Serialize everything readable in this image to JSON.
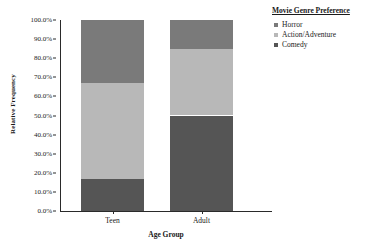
{
  "chart_data": {
    "type": "bar",
    "variant": "stacked-100-percent",
    "title": "",
    "xlabel": "Age Group",
    "ylabel": "Relative Frequency",
    "categories": [
      "Teen",
      "Adult"
    ],
    "series": [
      {
        "name": "Comedy",
        "values": [
          17,
          50
        ],
        "color": "#555555"
      },
      {
        "name": "Action/Adventure",
        "values": [
          50,
          35
        ],
        "color": "#b8b8b8"
      },
      {
        "name": "Horror",
        "values": [
          33,
          15
        ],
        "color": "#7a7a7a"
      }
    ],
    "ylim": [
      0,
      100
    ],
    "ytick_values": [
      0,
      10,
      20,
      30,
      40,
      50,
      60,
      70,
      80,
      90,
      100
    ],
    "ytick_labels": [
      "0.0%",
      "10.0%",
      "20.0%",
      "30.0%",
      "40.0%",
      "50.0%",
      "60.0%",
      "70.0%",
      "80.0%",
      "90.0%",
      "100.0%"
    ],
    "grid": false,
    "legend_position": "right",
    "legend_title": "Movie Genre Preference",
    "legend_entries": [
      "Horror",
      "Action/Adventure",
      "Comedy"
    ]
  },
  "axes": {
    "y_title": "Relative Frequency",
    "x_title": "Age Group"
  },
  "legend": {
    "title": "Movie Genre Preference",
    "items": [
      {
        "label": "Horror",
        "color": "#7a7a7a"
      },
      {
        "label": "Action/Adventure",
        "color": "#b8b8b8"
      },
      {
        "label": "Comedy",
        "color": "#555555"
      }
    ]
  },
  "colors": {
    "horror": "#7a7a7a",
    "action_adventure": "#b8b8b8",
    "comedy": "#555555",
    "axis": "#2a2a2a",
    "background": "#ffffff"
  }
}
